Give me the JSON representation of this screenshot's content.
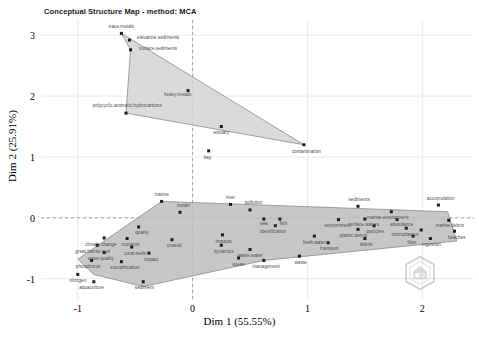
{
  "chart_data": {
    "type": "scatter",
    "title": "Conceptual Structure Map - method: MCA",
    "xlabel": "Dim 1 (55.55%)",
    "ylabel": "Dim 2 (25.91%)",
    "xlim": [
      -1.32,
      2.45
    ],
    "ylim": [
      -1.35,
      3.25
    ],
    "xticks": [
      "-1",
      "0",
      "1",
      "2"
    ],
    "xtickvals": [
      -1,
      0,
      1,
      2
    ],
    "yticks": [
      "3",
      "2",
      "1",
      "0",
      "-1"
    ],
    "ytickvals": [
      3,
      2,
      1,
      0,
      -1
    ],
    "grid": true,
    "legend": "none",
    "reference_lines": {
      "vertical_dashed_x": 0,
      "horizontal_dashed_y": 0,
      "color": "#9a9a9a"
    },
    "clusters": [
      {
        "name": "cluster-1",
        "fill": "#d4d4d4",
        "stroke": "#8a8a8a",
        "hull": [
          [
            -0.62,
            3.03
          ],
          [
            0.97,
            1.2
          ],
          [
            -0.58,
            1.72
          ],
          [
            -0.54,
            2.76
          ]
        ],
        "points": [
          {
            "label": "trace.metals",
            "x": -0.62,
            "y": 3.03
          },
          {
            "label": "estuarine.sediments",
            "x": -0.55,
            "y": 2.92
          },
          {
            "label": "surface.sediments",
            "x": -0.54,
            "y": 2.76
          },
          {
            "label": "heavy.metals",
            "x": -0.04,
            "y": 2.09
          },
          {
            "label": "polycyclic.aromatic.hydrocarbons",
            "x": -0.58,
            "y": 1.72
          },
          {
            "label": "estuary",
            "x": 0.25,
            "y": 1.5
          },
          {
            "label": "bay",
            "x": 0.14,
            "y": 1.1
          },
          {
            "label": "contamination",
            "x": 0.97,
            "y": 1.2
          }
        ]
      },
      {
        "name": "cluster-2",
        "fill": "#bdbdbd",
        "stroke": "#8a8a8a",
        "hull": [
          [
            -0.27,
            0.27
          ],
          [
            2.22,
            0.1
          ],
          [
            2.3,
            -0.38
          ],
          [
            0.62,
            -0.7
          ],
          [
            -0.43,
            -1.13
          ],
          [
            -0.86,
            -0.93
          ],
          [
            -1.0,
            -0.68
          ]
        ],
        "points": [
          {
            "label": "marine",
            "x": -0.27,
            "y": 0.27
          },
          {
            "label": "river",
            "x": 0.33,
            "y": 0.22
          },
          {
            "label": "pollution",
            "x": 0.5,
            "y": 0.13
          },
          {
            "label": "sediments",
            "x": 1.44,
            "y": 0.19
          },
          {
            "label": "accumulation",
            "x": 2.14,
            "y": 0.21
          },
          {
            "label": "model",
            "x": -0.11,
            "y": 0.09
          },
          {
            "label": "marine.environment",
            "x": 1.73,
            "y": 0.1
          },
          {
            "label": "sea",
            "x": 0.62,
            "y": -0.02
          },
          {
            "label": "fish",
            "x": 0.76,
            "y": -0.02
          },
          {
            "label": "environment",
            "x": 1.27,
            "y": -0.03
          },
          {
            "label": "surface.waters",
            "x": 1.5,
            "y": -0.02
          },
          {
            "label": "abundance",
            "x": 1.78,
            "y": -0.03
          },
          {
            "label": "marine.debris",
            "x": 2.23,
            "y": -0.04
          },
          {
            "label": "quality",
            "x": -0.47,
            "y": -0.15
          },
          {
            "label": "identification",
            "x": 0.72,
            "y": -0.13
          },
          {
            "label": "particles",
            "x": 1.58,
            "y": -0.13
          },
          {
            "label": "plastic.debris",
            "x": 1.44,
            "y": -0.19
          },
          {
            "label": "microplastics",
            "x": 1.86,
            "y": -0.17
          },
          {
            "label": "abundance.pt2",
            "x": 1.99,
            "y": -0.2
          },
          {
            "label": "beaches",
            "x": 2.28,
            "y": -0.22
          },
          {
            "label": "climate.change",
            "x": -0.77,
            "y": -0.33
          },
          {
            "label": "nutrients",
            "x": -0.57,
            "y": -0.34
          },
          {
            "label": "impacts",
            "x": 0.26,
            "y": -0.28
          },
          {
            "label": "coastal",
            "x": -0.18,
            "y": -0.36
          },
          {
            "label": "fresh.water",
            "x": 1.06,
            "y": -0.3
          },
          {
            "label": "debris",
            "x": 1.5,
            "y": -0.34
          },
          {
            "label": "great.barrier.reef",
            "x": -0.83,
            "y": -0.45
          },
          {
            "label": "coral.reefs",
            "x": -0.53,
            "y": -0.48
          },
          {
            "label": "dynamics",
            "x": 0.25,
            "y": -0.45
          },
          {
            "label": "transport",
            "x": 1.18,
            "y": -0.41
          },
          {
            "label": "water.quality",
            "x": -0.77,
            "y": -0.57
          },
          {
            "label": "waste.water",
            "x": 0.5,
            "y": -0.52
          },
          {
            "label": "impact",
            "x": -0.38,
            "y": -0.58
          },
          {
            "label": "ingestion",
            "x": 2.07,
            "y": -0.34
          },
          {
            "label": "litter",
            "x": 1.92,
            "y": -0.3
          },
          {
            "label": "phosphorus",
            "x": -0.88,
            "y": -0.7
          },
          {
            "label": "eutrophication",
            "x": -0.62,
            "y": -0.72
          },
          {
            "label": "ocean",
            "x": 0.4,
            "y": -0.66
          },
          {
            "label": "waste",
            "x": 0.93,
            "y": -0.63
          },
          {
            "label": "management",
            "x": 0.62,
            "y": -0.7
          },
          {
            "label": "nitrogen",
            "x": -1.0,
            "y": -0.93
          },
          {
            "label": "aquaculture",
            "x": -0.86,
            "y": -1.05
          },
          {
            "label": "sediment",
            "x": -0.43,
            "y": -1.05
          }
        ]
      }
    ],
    "point_labels": [
      {
        "text": "trace.metals",
        "x": -0.62,
        "y": 3.14,
        "anchor": "middle"
      },
      {
        "text": "estuarine.sediments",
        "x": -0.3,
        "y": 2.95,
        "anchor": "middle"
      },
      {
        "text": "surface.sediments",
        "x": -0.3,
        "y": 2.78,
        "anchor": "middle"
      },
      {
        "text": "heavy.metals",
        "x": -0.13,
        "y": 2.02,
        "anchor": "middle"
      },
      {
        "text": "polycyclic.aromatic.hydrocarbons",
        "x": -0.57,
        "y": 1.83,
        "anchor": "middle"
      },
      {
        "text": "estuary",
        "x": 0.25,
        "y": 1.39,
        "anchor": "middle"
      },
      {
        "text": "bay",
        "x": 0.13,
        "y": 0.98,
        "anchor": "middle"
      },
      {
        "text": "contamination",
        "x": 0.99,
        "y": 1.08,
        "anchor": "middle"
      },
      {
        "text": "marine",
        "x": -0.27,
        "y": 0.38,
        "anchor": "middle"
      },
      {
        "text": "river",
        "x": 0.33,
        "y": 0.32,
        "anchor": "middle"
      },
      {
        "text": "pollution",
        "x": 0.53,
        "y": 0.24,
        "anchor": "middle"
      },
      {
        "text": "sediments",
        "x": 1.45,
        "y": 0.3,
        "anchor": "middle"
      },
      {
        "text": "accumulation",
        "x": 2.16,
        "y": 0.31,
        "anchor": "middle"
      },
      {
        "text": "model",
        "x": -0.08,
        "y": 0.2,
        "anchor": "middle"
      },
      {
        "text": "marine.environment",
        "x": 1.7,
        "y": 0.0,
        "anchor": "middle"
      },
      {
        "text": "sea",
        "x": 0.62,
        "y": -0.1,
        "anchor": "middle"
      },
      {
        "text": "fish",
        "x": 0.79,
        "y": -0.1,
        "anchor": "middle"
      },
      {
        "text": "environment",
        "x": 1.26,
        "y": -0.13,
        "anchor": "middle"
      },
      {
        "text": "surface.waters",
        "x": 1.49,
        "y": -0.12,
        "anchor": "middle"
      },
      {
        "text": "abundance",
        "x": 1.82,
        "y": -0.12,
        "anchor": "middle"
      },
      {
        "text": "marine.debris",
        "x": 2.24,
        "y": -0.14,
        "anchor": "middle"
      },
      {
        "text": "quality",
        "x": -0.44,
        "y": -0.25,
        "anchor": "middle"
      },
      {
        "text": "identification",
        "x": 0.7,
        "y": -0.24,
        "anchor": "middle"
      },
      {
        "text": "particles",
        "x": 1.59,
        "y": -0.24,
        "anchor": "middle"
      },
      {
        "text": "plastic.debris",
        "x": 1.4,
        "y": -0.3,
        "anchor": "middle"
      },
      {
        "text": "microplastics",
        "x": 1.85,
        "y": -0.28,
        "anchor": "middle"
      },
      {
        "text": "beaches",
        "x": 2.3,
        "y": -0.33,
        "anchor": "middle"
      },
      {
        "text": "climate.change",
        "x": -0.8,
        "y": -0.44,
        "anchor": "middle"
      },
      {
        "text": "nutrients",
        "x": -0.54,
        "y": -0.45,
        "anchor": "middle"
      },
      {
        "text": "impacts",
        "x": 0.27,
        "y": -0.39,
        "anchor": "middle"
      },
      {
        "text": "coastal",
        "x": -0.16,
        "y": -0.47,
        "anchor": "middle"
      },
      {
        "text": "fresh.water",
        "x": 1.06,
        "y": -0.41,
        "anchor": "middle"
      },
      {
        "text": "debris",
        "x": 1.51,
        "y": -0.45,
        "anchor": "middle"
      },
      {
        "text": "great.barrier.reef",
        "x": -0.87,
        "y": -0.56,
        "anchor": "middle"
      },
      {
        "text": "coral.reefs",
        "x": -0.5,
        "y": -0.59,
        "anchor": "middle"
      },
      {
        "text": "dynamics",
        "x": 0.27,
        "y": -0.56,
        "anchor": "middle"
      },
      {
        "text": "transport",
        "x": 1.19,
        "y": -0.52,
        "anchor": "middle"
      },
      {
        "text": "water.quality",
        "x": -0.8,
        "y": -0.68,
        "anchor": "middle"
      },
      {
        "text": "waste.water",
        "x": 0.5,
        "y": -0.63,
        "anchor": "middle"
      },
      {
        "text": "impact",
        "x": -0.36,
        "y": -0.69,
        "anchor": "middle"
      },
      {
        "text": "ingestion",
        "x": 2.08,
        "y": -0.45,
        "anchor": "middle"
      },
      {
        "text": "litter",
        "x": 1.91,
        "y": -0.41,
        "anchor": "middle"
      },
      {
        "text": "phosphorus",
        "x": -0.91,
        "y": -0.81,
        "anchor": "middle"
      },
      {
        "text": "eutrophication",
        "x": -0.59,
        "y": -0.83,
        "anchor": "middle"
      },
      {
        "text": "ocean",
        "x": 0.4,
        "y": -0.77,
        "anchor": "middle"
      },
      {
        "text": "waste",
        "x": 0.94,
        "y": -0.74,
        "anchor": "middle"
      },
      {
        "text": "management",
        "x": 0.64,
        "y": -0.81,
        "anchor": "middle"
      },
      {
        "text": "nitrogen",
        "x": -1.0,
        "y": -1.04,
        "anchor": "middle"
      },
      {
        "text": "aquaculture",
        "x": -0.88,
        "y": -1.16,
        "anchor": "middle"
      },
      {
        "text": "sediment",
        "x": -0.42,
        "y": -1.16,
        "anchor": "middle"
      }
    ],
    "watermark": "bibliometrix-hex-logo"
  }
}
